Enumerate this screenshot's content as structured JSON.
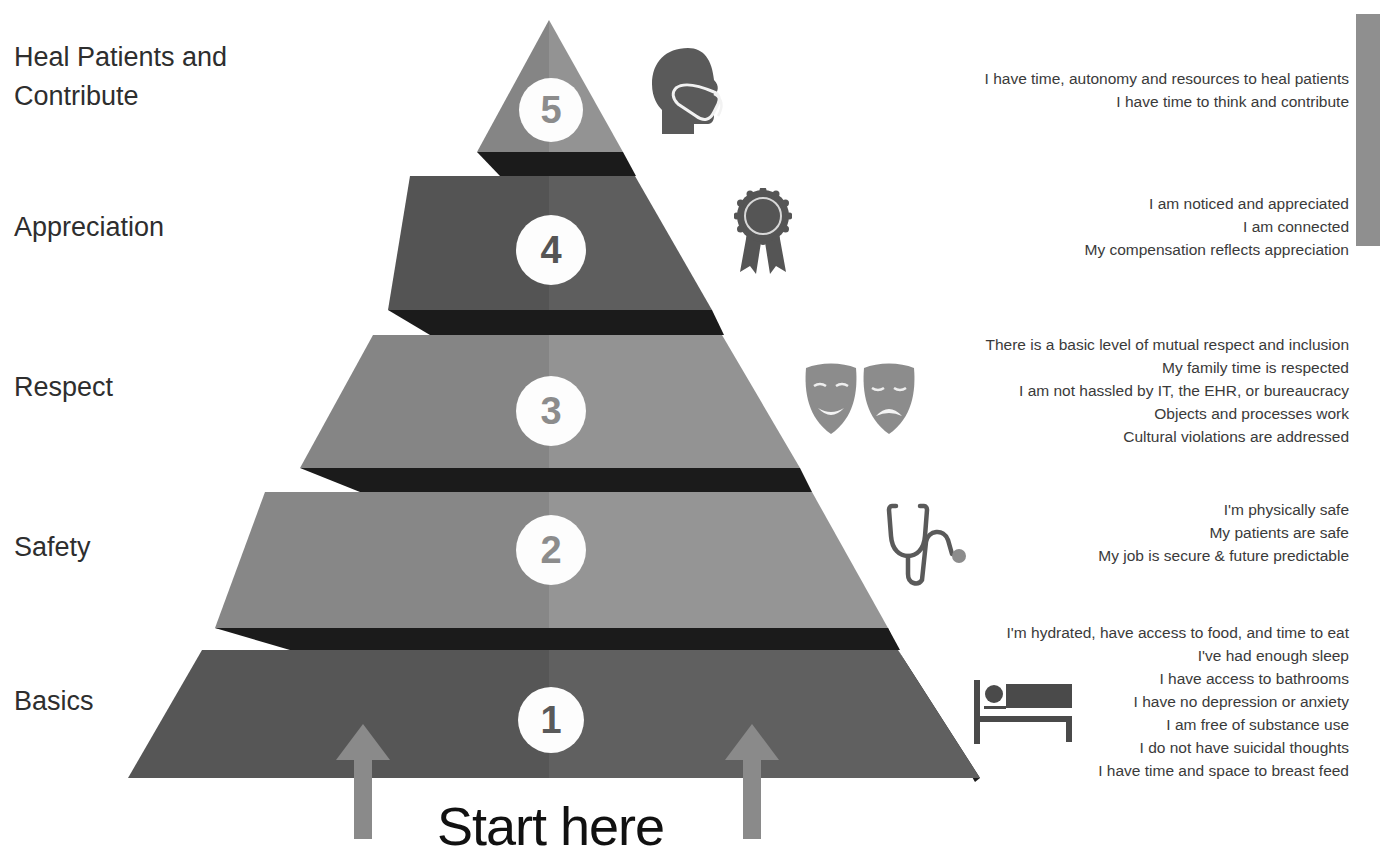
{
  "levels": [
    {
      "number": "5",
      "label": "Heal Patients and\nContribute",
      "icon": "masked-head-icon",
      "descriptions": [
        "I have time, autonomy and resources to heal patients",
        "I have time to think and contribute"
      ]
    },
    {
      "number": "4",
      "label": "Appreciation",
      "icon": "award-ribbon-icon",
      "descriptions": [
        "I am noticed and appreciated",
        "I am connected",
        "My compensation reflects appreciation"
      ]
    },
    {
      "number": "3",
      "label": "Respect",
      "icon": "theater-masks-icon",
      "descriptions": [
        "There is a basic level of mutual respect and inclusion",
        "My family time is respected",
        "I am not hassled by IT, the EHR, or bureaucracy",
        "Objects and processes work",
        "Cultural violations are addressed"
      ]
    },
    {
      "number": "2",
      "label": "Safety",
      "icon": "stethoscope-icon",
      "descriptions": [
        "I'm physically safe",
        "My patients are safe",
        "My job is secure & future predictable"
      ]
    },
    {
      "number": "1",
      "label": "Basics",
      "icon": "bed-icon",
      "descriptions": [
        "I'm hydrated, have access to food, and time to eat",
        "I've had enough sleep",
        "I have access to bathrooms",
        "I have no depression or anxiety",
        "I am free of substance use",
        "I do not have suicidal thoughts",
        "I  have time and space to breast feed"
      ]
    }
  ],
  "footer": {
    "start_label": "Start here"
  },
  "colors": {
    "tier_light_left": "#868686",
    "tier_light_right": "#949494",
    "tier_dark_left": "#555555",
    "tier_dark_right": "#606060",
    "shadow": "#1a1a1a",
    "arrow": "#8a8a8a",
    "icon": "#5a5a5a",
    "icon_light": "#8c8c8c"
  }
}
